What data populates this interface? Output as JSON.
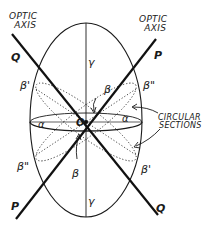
{
  "figure": {
    "type": "indicatrix-diagram",
    "labels": {
      "optic_axis_left_line1": "OPTIC",
      "optic_axis_left_line2": "AXIS",
      "optic_axis_right_line1": "OPTIC",
      "optic_axis_right_line2": "AXIS",
      "circular_sections_line1": "CIRCULAR",
      "circular_sections_line2": "SECTIONS",
      "q_top": "Q",
      "q_bottom": "Q",
      "p_top": "P",
      "p_bottom": "P",
      "origin": "O",
      "gamma_top": "γ",
      "gamma_bottom": "γ",
      "beta_top": "β",
      "beta_bottom": "β",
      "beta_prime_left": "β'",
      "beta_prime_right": "β'",
      "beta_dprime_right": "β\"",
      "beta_dprime_left": "β\"",
      "alpha_left": "α",
      "alpha_right": "α"
    },
    "colors": {
      "ink": "#1a1a1a",
      "background": "#ffffff"
    }
  }
}
